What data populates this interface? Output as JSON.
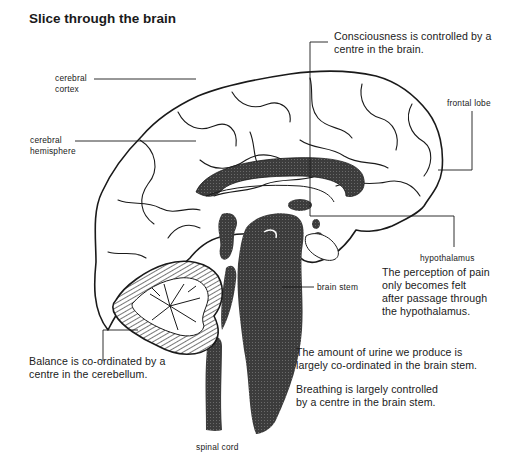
{
  "title": "Slice through the brain",
  "labels": {
    "cerebral_cortex": [
      "cerebral",
      "cortex"
    ],
    "cerebral_hemisphere": [
      "cerebral",
      "hemisphere"
    ],
    "frontal_lobe": "frontal lobe",
    "hypothalamus": "hypothalamus",
    "brain_stem": "brain stem",
    "spinal_cord": "spinal cord"
  },
  "notes": {
    "consciousness": [
      "Consciousness is controlled by a",
      "centre in the brain."
    ],
    "pain": [
      "The perception of pain",
      "only becomes felt",
      "after passage through",
      "the hypothalamus."
    ],
    "balance": [
      "Balance is co-ordinated by a",
      "centre in the cerebellum."
    ],
    "urine": [
      "The amount of urine we produce is",
      "largely co-ordinated in the brain stem."
    ],
    "breathing": [
      "Breathing is largely controlled",
      "by a centre in the brain stem."
    ]
  },
  "colors": {
    "ink": "#1a1a1a",
    "shade": "#3c3c3c",
    "background": "#ffffff"
  }
}
